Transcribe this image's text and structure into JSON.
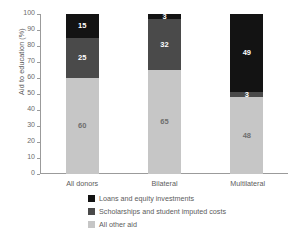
{
  "chart_data": {
    "type": "bar",
    "subtype": "stacked-100",
    "title": "",
    "xlabel": "",
    "ylabel": "Aid to education (%)",
    "ylim": [
      0,
      100
    ],
    "yticks": [
      0,
      10,
      20,
      30,
      40,
      50,
      60,
      70,
      80,
      90,
      100
    ],
    "ytick_labels": [
      "0",
      "10",
      "20",
      "30",
      "40",
      "50",
      "60",
      "70",
      "80",
      "90",
      "100"
    ],
    "grid": false,
    "legend_position": "bottom",
    "categories": [
      "All donors",
      "Bilateral",
      "Multilateral"
    ],
    "series": [
      {
        "name": "Loans and equity investments",
        "color": "#131313",
        "values": [
          15,
          3,
          49
        ],
        "labels": [
          "15",
          "3",
          "49"
        ]
      },
      {
        "name": "Scholarships and student imputed costs",
        "color": "#4a4a4a",
        "values": [
          25,
          32,
          3
        ],
        "labels": [
          "25",
          "32",
          "3"
        ]
      },
      {
        "name": "All other aid",
        "color": "#c6c6c6",
        "values": [
          60,
          65,
          48
        ],
        "labels": [
          "60",
          "65",
          "48"
        ]
      }
    ]
  },
  "legend": {
    "items": [
      {
        "label": "Loans and equity investments",
        "color": "#131313"
      },
      {
        "label": "Scholarships and student imputed costs",
        "color": "#4a4a4a"
      },
      {
        "label": "All other aid",
        "color": "#c6c6c6"
      }
    ]
  },
  "axis": {
    "y_title": "Aid to education (%)"
  }
}
